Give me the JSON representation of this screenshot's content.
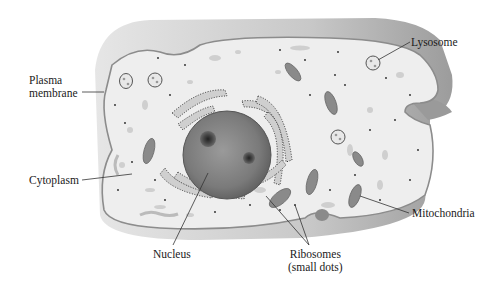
{
  "diagram": {
    "type": "cell-structure",
    "colors": {
      "background": "#ffffff",
      "cell_outer_top": "#b4b4b4",
      "cell_outer_side": "#e0e0e0",
      "cytoplasm": "#eeeeee",
      "membrane": "#8c8c8c",
      "nucleus": "#777777",
      "nucleolus": "#3c3c3c",
      "organelle": "#8a8a8a",
      "leader_line": "#333333",
      "label_text": "#1a1a1a"
    }
  },
  "labels": {
    "plasma_membrane_1": "Plasma",
    "plasma_membrane_2": "membrane",
    "lysosome": "Lysosome",
    "cytoplasm": "Cytoplasm",
    "nucleus": "Nucleus",
    "mitochondria": "Mitochondria",
    "ribosomes_1": "Ribosomes",
    "ribosomes_2": "(small dots)"
  }
}
